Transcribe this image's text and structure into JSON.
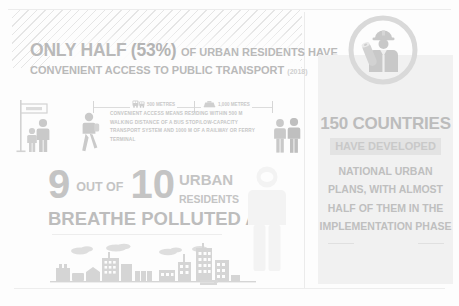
{
  "poster": {
    "left_panel": {
      "headline": {
        "only_half": "ONLY HALF",
        "percent": "(53%)",
        "tail": "OF URBAN RESIDENTS HAVE",
        "line2": "CONVENIENT ACCESS TO PUBLIC TRANSPORT",
        "year": "(2018)"
      },
      "scale": {
        "bus_label": "500 METRES",
        "train_label": "1,000 METRES",
        "bus_icon": "bus-icon",
        "train_icon": "train-icon"
      },
      "caption": "CONVENIENT ACCESS MEANS RESIDING WITHIN 500 M WALKING DISTANCE OF A BUS STOP/LOW-CAPACITY TRANSPORT SYSTEM AND 1000 M OF A RAILWAY OR FERRY TERMINAL",
      "pollution_stat": {
        "nine": "9",
        "out_of": "OUT OF",
        "ten": "10",
        "urban": "URBAN",
        "residents": "RESIDENTS",
        "breathe": "BREATHE POLLUTED AIR"
      },
      "illustrations": {
        "bus_stop": "bus-stop-icon",
        "walking_person": "walking-person-icon",
        "standing_people": "standing-people-icon",
        "human_silhouette": "human-silhouette-icon",
        "city_skyline": "city-skyline-illustration"
      }
    },
    "right_panel": {
      "badge_icon": "urban-planner-badge-icon",
      "countries": "150 COUNTRIES",
      "have_developed": "HAVE DEVELOPED",
      "body": "NATIONAL URBAN PLANS, WITH ALMOST HALF OF THEM IN THE IMPLEMENTATION PHASE"
    }
  },
  "colors": {
    "text_gray": "#bdbdbd",
    "panel_bg": "#f1f1f1",
    "highlight_band": "#e3e3e3",
    "page_bg": "#fdfdfd"
  }
}
